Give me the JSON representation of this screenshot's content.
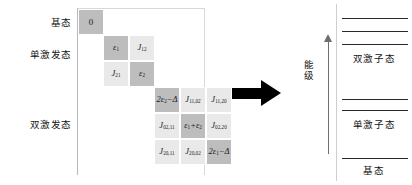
{
  "figure": {
    "matrix": {
      "row_labels": [
        {
          "key": "ground",
          "label": "基态"
        },
        {
          "key": "single",
          "label": "单激发态"
        },
        {
          "key": "double",
          "label": "双激发态"
        }
      ],
      "blocks": {
        "ground": {
          "cells": [
            {
              "r": 0,
              "c": 0,
              "kind": "diag",
              "text": "0"
            }
          ]
        },
        "single": {
          "cells": [
            {
              "r": 0,
              "c": 0,
              "kind": "diag",
              "tex": "eps1",
              "base": "ε",
              "sub": "1"
            },
            {
              "r": 0,
              "c": 1,
              "kind": "off",
              "tex": "J12",
              "base": "J",
              "sub": "12"
            },
            {
              "r": 1,
              "c": 0,
              "kind": "off",
              "tex": "J21",
              "base": "J",
              "sub": "21"
            },
            {
              "r": 1,
              "c": 1,
              "kind": "diag",
              "tex": "eps2",
              "base": "ε",
              "sub": "2"
            }
          ]
        },
        "double": {
          "cells": [
            {
              "r": 0,
              "c": 0,
              "kind": "diag",
              "text": "2ε2−Δ",
              "base": "2ε",
              "sub": "2",
              "tail": "−Δ"
            },
            {
              "r": 0,
              "c": 1,
              "kind": "off",
              "base": "J",
              "sub": "11,02"
            },
            {
              "r": 0,
              "c": 2,
              "kind": "off",
              "base": "J",
              "sub": "11,20"
            },
            {
              "r": 1,
              "c": 0,
              "kind": "off",
              "base": "J",
              "sub": "02,11"
            },
            {
              "r": 1,
              "c": 1,
              "kind": "diag",
              "text": "ε1+ε2",
              "base": "ε",
              "sub": "1",
              "mid": "+ε",
              "sub2": "2"
            },
            {
              "r": 1,
              "c": 2,
              "kind": "off",
              "base": "J",
              "sub": "02,20"
            },
            {
              "r": 2,
              "c": 0,
              "kind": "off",
              "base": "J",
              "sub": "20,11"
            },
            {
              "r": 2,
              "c": 1,
              "kind": "off",
              "base": "J",
              "sub": "20,02"
            },
            {
              "r": 2,
              "c": 2,
              "kind": "diag",
              "text": "2ε1−Δ",
              "base": "2ε",
              "sub": "1",
              "tail": "−Δ"
            }
          ]
        }
      },
      "colors": {
        "diagonal_fill": "#bdbdbd",
        "offdiagonal_fill": "#e9e9e9",
        "frame_line": "#b9b9b9",
        "text": "#1a1a1a"
      }
    },
    "arrow": {
      "direction": "right",
      "color": "#000000"
    },
    "energy_diagram": {
      "axis_label": "能级",
      "axis_color": "#6e6e6e",
      "level_color": "#2a2a2a",
      "levels": [
        {
          "key": "biexciton-3",
          "y": 18
        },
        {
          "key": "biexciton-2",
          "y": 31
        },
        {
          "key": "biexciton-1",
          "y": 44
        },
        {
          "key": "exciton-2",
          "y": 99
        },
        {
          "key": "exciton-1",
          "y": 110
        },
        {
          "key": "ground",
          "y": 158
        }
      ],
      "level_labels": [
        {
          "key": "biexciton",
          "label": "双激子态",
          "y": 52
        },
        {
          "key": "exciton",
          "label": "单激子态",
          "y": 118
        },
        {
          "key": "ground",
          "label": "基态",
          "y": 163
        }
      ]
    }
  }
}
